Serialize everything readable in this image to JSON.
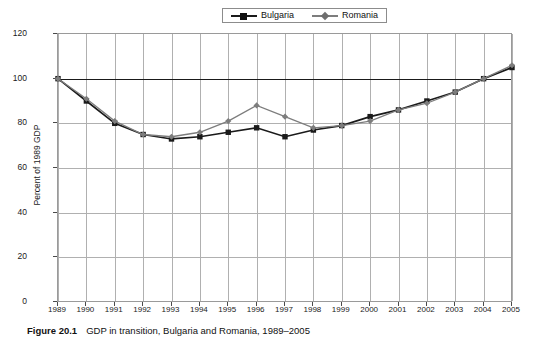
{
  "figure": {
    "number_label": "Figure 20.1",
    "caption": "GDP in transition, Bulgaria and Romania, 1989–2005"
  },
  "legend": {
    "position": "top-center",
    "entries": [
      {
        "label": "Bulgaria",
        "color": "#1a1a1a",
        "marker": "square"
      },
      {
        "label": "Romania",
        "color": "#7d7d7d",
        "marker": "diamond"
      }
    ]
  },
  "axes": {
    "ylabel": "Percent of 1989 GDP",
    "yticks": [
      "0",
      "20",
      "40",
      "60",
      "80",
      "100",
      "120"
    ],
    "xticks": [
      "1989",
      "1990",
      "1991",
      "1992",
      "1993",
      "1994",
      "1995",
      "1996",
      "1997",
      "1998",
      "1999",
      "2000",
      "2001",
      "2002",
      "2003",
      "2004",
      "2005"
    ]
  },
  "chart_data": {
    "type": "line",
    "title": "GDP in transition, Bulgaria and Romania, 1989–2005",
    "xlabel": "",
    "ylabel": "Percent of 1989 GDP",
    "ylim": [
      0,
      120
    ],
    "ytick_step": 20,
    "grid": true,
    "legend_position": "top-center",
    "reference_line": 100,
    "categories": [
      "1989",
      "1990",
      "1991",
      "1992",
      "1993",
      "1994",
      "1995",
      "1996",
      "1997",
      "1998",
      "1999",
      "2000",
      "2001",
      "2002",
      "2003",
      "2004",
      "2005"
    ],
    "series": [
      {
        "name": "Bulgaria",
        "color": "#1a1a1a",
        "marker": "square",
        "values": [
          100,
          90,
          80,
          75,
          73,
          74,
          76,
          78,
          74,
          77,
          79,
          83,
          86,
          90,
          94,
          100,
          105
        ]
      },
      {
        "name": "Romania",
        "color": "#7d7d7d",
        "marker": "diamond",
        "values": [
          100,
          91,
          81,
          75,
          74,
          76,
          81,
          88,
          83,
          78,
          79,
          81,
          86,
          89,
          94,
          100,
          106
        ]
      }
    ]
  }
}
